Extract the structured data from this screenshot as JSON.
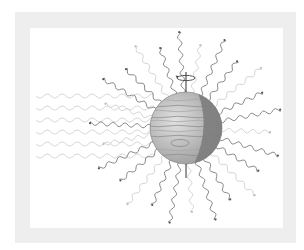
{
  "figure": {
    "colors": {
      "frame": "#eeeeee",
      "panel": "#ffffff",
      "incoming_wave": "#d6d6d6",
      "emitted_wave_dark": "#7a7a7a",
      "emitted_wave_light": "#cfcfcf",
      "planet_day": "#bdbdbd",
      "planet_night": "#7d7d7d",
      "axis": "#333333"
    },
    "incoming_waves": {
      "count": 6,
      "direction": "left-to-right"
    },
    "emitted_waves": {
      "count": 26,
      "direction": "radial-outward"
    },
    "rotation_axis": {
      "visible": true,
      "rotation_arrow": true
    }
  }
}
